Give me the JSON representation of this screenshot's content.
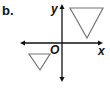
{
  "figure": {
    "part_label": "b.",
    "axes": {
      "x_label": "x",
      "y_label": "y",
      "origin_label": "O"
    },
    "shapes": [
      {
        "name": "large-triangle",
        "type": "triangle",
        "orientation": "pointing-down",
        "quadrant": "I"
      },
      {
        "name": "small-triangle",
        "type": "triangle",
        "orientation": "pointing-down",
        "quadrant": "III"
      }
    ],
    "colors": {
      "axes": "#111111",
      "triangles": "#777777"
    }
  }
}
